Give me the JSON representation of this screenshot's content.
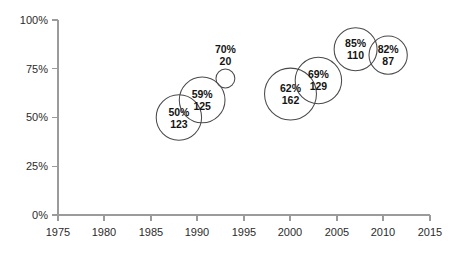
{
  "chart_data": {
    "type": "scatter",
    "variant": "bubble",
    "title": "",
    "subtitle": "",
    "xlabel": "",
    "ylabel": "",
    "xlim": [
      1975,
      2015
    ],
    "ylim": [
      0,
      100
    ],
    "xticks": [
      "1975",
      "1980",
      "1985",
      "1990",
      "1995",
      "2000",
      "2005",
      "2010",
      "2015"
    ],
    "yticks": [
      "0%",
      "25%",
      "50%",
      "75%",
      "100%"
    ],
    "grid": false,
    "legend": "none",
    "points": [
      {
        "x": 1988,
        "y": 50,
        "size": 123,
        "percent_label": "50%",
        "value_label": "123"
      },
      {
        "x": 1990.5,
        "y": 59,
        "size": 125,
        "percent_label": "59%",
        "value_label": "125"
      },
      {
        "x": 1993,
        "y": 70,
        "size": 20,
        "percent_label": "70%",
        "value_label": "20"
      },
      {
        "x": 2000,
        "y": 62,
        "size": 162,
        "percent_label": "62%",
        "value_label": "162"
      },
      {
        "x": 2003,
        "y": 69,
        "size": 129,
        "percent_label": "69%",
        "value_label": "129"
      },
      {
        "x": 2007,
        "y": 85,
        "size": 110,
        "percent_label": "85%",
        "value_label": "110"
      },
      {
        "x": 2010.5,
        "y": 82,
        "size": 87,
        "percent_label": "82%",
        "value_label": "87"
      }
    ]
  },
  "style": {
    "axis_color": "#9b9b9b",
    "bubble_stroke": "#4a4a4a",
    "label_color": "#141414",
    "tick_color": "#2b2b2b",
    "background": "#ffffff"
  },
  "geometry": {
    "plot_left": 58,
    "plot_baseline": 215,
    "plot_top": 20,
    "plot_right": 430,
    "x_per_year": 9.3,
    "x_origin_year": 1975
  }
}
